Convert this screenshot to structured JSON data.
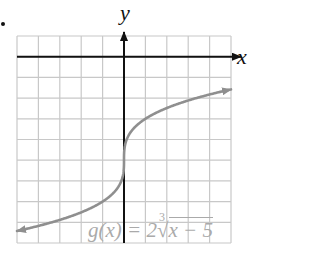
{
  "chart_data": {
    "type": "line",
    "title": "",
    "xlabel": "x",
    "ylabel": "y",
    "xlim": [
      -5,
      5
    ],
    "ylim": [
      -9,
      1
    ],
    "grid": true,
    "grid_step": 1,
    "function_label": "g(x) = 2∛x − 5",
    "function": "2*cbrt(x) - 5",
    "series": [
      {
        "name": "g(x)",
        "x": [
          -5,
          -4,
          -3,
          -2,
          -1,
          -0.5,
          -0.1,
          0,
          0.1,
          0.5,
          1,
          2,
          3,
          4,
          5
        ],
        "values": [
          -8.42,
          -8.17,
          -7.88,
          -7.52,
          -7.0,
          -6.59,
          -5.93,
          -5.0,
          -4.07,
          -3.41,
          -3.0,
          -2.48,
          -2.12,
          -1.83,
          -1.58
        ]
      }
    ]
  },
  "labels": {
    "x_axis": "x",
    "y_axis": "y",
    "formula_prefix": "g(x) = 2",
    "formula_index": "3",
    "formula_radicand": "x − 5"
  },
  "colors": {
    "axis": "#111111",
    "grid": "#c8c8c8",
    "curve": "#8f8f8f",
    "formula": "#aaaaaa"
  }
}
